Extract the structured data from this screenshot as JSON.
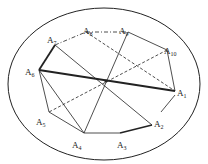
{
  "figure": {
    "ellipse": {
      "cx": 104,
      "cy": 84,
      "rx": 96,
      "ry": 76
    },
    "center": {
      "x": 106,
      "y": 81
    },
    "points": [
      {
        "id": "A1",
        "base": "A",
        "sub": "1",
        "x": 175,
        "y": 91,
        "lx": 177,
        "ly": 96
      },
      {
        "id": "A2",
        "base": "A",
        "sub": "2",
        "x": 152,
        "y": 125,
        "lx": 154,
        "ly": 127
      },
      {
        "id": "A3",
        "base": "A",
        "sub": "3",
        "x": 120,
        "y": 133,
        "lx": 117,
        "ly": 148
      },
      {
        "id": "A4",
        "base": "A",
        "sub": "4",
        "x": 84,
        "y": 133,
        "lx": 72,
        "ly": 148
      },
      {
        "id": "A5",
        "base": "A",
        "sub": "5",
        "x": 49,
        "y": 112,
        "lx": 36,
        "ly": 125
      },
      {
        "id": "A6",
        "base": "A",
        "sub": "6",
        "x": 39,
        "y": 70,
        "lx": 25,
        "ly": 75
      },
      {
        "id": "A7",
        "base": "A",
        "sub": "7",
        "x": 55,
        "y": 45,
        "lx": 47,
        "ly": 43
      },
      {
        "id": "A8",
        "base": "A",
        "sub": "8",
        "x": 86,
        "y": 32,
        "lx": 83,
        "ly": 34
      },
      {
        "id": "A9",
        "base": "A",
        "sub": "9",
        "x": 128,
        "y": 32,
        "lx": 119,
        "ly": 34
      },
      {
        "id": "A10",
        "base": "A",
        "sub": "10",
        "x": 167,
        "y": 50,
        "lx": 164,
        "ly": 54
      }
    ],
    "segments": [
      {
        "from": "A6",
        "to": "A1",
        "style": "thick"
      },
      {
        "from": "A7",
        "to": "A6",
        "style": "thick"
      },
      {
        "from": "A3",
        "to": "A2",
        "style": "thick"
      },
      {
        "from": "A7",
        "to": "A2",
        "style": "solid"
      },
      {
        "from": "A9",
        "to": "A4",
        "style": "solid"
      },
      {
        "from": "A6",
        "to": "A5",
        "style": "solid"
      },
      {
        "from": "A5",
        "to": "A4",
        "style": "solid"
      },
      {
        "from": "A6",
        "to": "A4",
        "style": "solid"
      },
      {
        "from": "A4",
        "to": "A3",
        "style": "solid"
      },
      {
        "from": "A9",
        "to": "A10",
        "style": "solid"
      },
      {
        "from": "A10",
        "to": "A1",
        "style": "solid"
      },
      {
        "from": "A7",
        "to": "A8",
        "style": "dashdot"
      },
      {
        "from": "A8",
        "to": "A9",
        "style": "dashdot"
      },
      {
        "from": "A8",
        "to": "A1",
        "style": "dashed"
      },
      {
        "from": "A10",
        "to": "A5",
        "style": "dashed"
      }
    ],
    "partial_segments": [
      {
        "x1": 175,
        "y1": 95,
        "x2": 161,
        "y2": 112,
        "style": "solid"
      }
    ]
  }
}
